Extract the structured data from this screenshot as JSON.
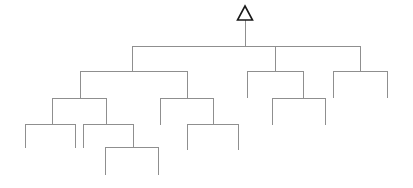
{
  "figure": {
    "type": "dendrogram",
    "title": "",
    "background_color": "#ffffff",
    "link_color": "#8f8f8f",
    "marker_color": "#1a1a1a",
    "orientation": "top-down",
    "width": 413,
    "height": 188
  },
  "root_marker": {
    "name": "root-triangle",
    "shape": "triangle",
    "x": 245,
    "y_top": 6,
    "y_bottom": 20,
    "half_width": 7.5,
    "fill": "#ffffff",
    "stroke": "#1a1a1a"
  },
  "chart_data": {
    "type": "dendrogram",
    "title": "",
    "xlabel": "",
    "ylabel": "",
    "grid": false,
    "legend": false,
    "root_symbol": "triangle",
    "levels": [
      46,
      71,
      98,
      124,
      147,
      175
    ],
    "merges": [
      {
        "id": "m0",
        "level_y": 46,
        "x": 245,
        "children_x": [
          132,
          275,
          360
        ],
        "label": "root-merge"
      },
      {
        "id": "m1",
        "level_y": 71,
        "x": 132,
        "children_x": [
          80,
          187
        ],
        "label": "left-merge"
      },
      {
        "id": "m2",
        "level_y": 71,
        "x": 275,
        "children_x": [
          247,
          303
        ],
        "label": "middle-merge"
      },
      {
        "id": "m3",
        "level_y": 71,
        "x": 360,
        "children_x": [
          333,
          387
        ],
        "label": "right-merge"
      },
      {
        "id": "m4",
        "level_y": 98,
        "x": 80,
        "children_x": [
          52,
          106
        ],
        "label": "left-a-merge"
      },
      {
        "id": "m5",
        "level_y": 98,
        "x": 187,
        "children_x": [
          160,
          213
        ],
        "label": "left-b-merge"
      },
      {
        "id": "m6",
        "level_y": 98,
        "x": 303,
        "children_x": [
          272,
          325
        ],
        "label": "middle-b-merge"
      },
      {
        "id": "m7",
        "level_y": 124,
        "x": 52,
        "children_x": [
          25,
          75
        ],
        "label": "leaf-group-1"
      },
      {
        "id": "m8",
        "level_y": 124,
        "x": 106,
        "children_x": [
          83,
          133
        ],
        "label": "leaf-group-2"
      },
      {
        "id": "m9",
        "level_y": 124,
        "x": 213,
        "children_x": [
          187,
          238
        ],
        "label": "leaf-group-3"
      },
      {
        "id": "m10",
        "level_y": 147,
        "x": 133,
        "children_x": [
          105,
          158
        ],
        "label": "leaf-group-4"
      }
    ],
    "leaves": [
      {
        "x": 25,
        "y_top": 124,
        "y_bottom": 148,
        "label": "leaf-1"
      },
      {
        "x": 75,
        "y_top": 124,
        "y_bottom": 148,
        "label": "leaf-2"
      },
      {
        "x": 83,
        "y_top": 124,
        "y_bottom": 148,
        "label": "leaf-3"
      },
      {
        "x": 105,
        "y_top": 147,
        "y_bottom": 175,
        "label": "leaf-4"
      },
      {
        "x": 158,
        "y_top": 147,
        "y_bottom": 175,
        "label": "leaf-5"
      },
      {
        "x": 160,
        "y_top": 98,
        "y_bottom": 125,
        "label": "leaf-6"
      },
      {
        "x": 187,
        "y_top": 124,
        "y_bottom": 150,
        "label": "leaf-7"
      },
      {
        "x": 238,
        "y_top": 124,
        "y_bottom": 150,
        "label": "leaf-8"
      },
      {
        "x": 247,
        "y_top": 71,
        "y_bottom": 98,
        "label": "leaf-9"
      },
      {
        "x": 272,
        "y_top": 98,
        "y_bottom": 125,
        "label": "leaf-10"
      },
      {
        "x": 325,
        "y_top": 98,
        "y_bottom": 125,
        "label": "leaf-11"
      },
      {
        "x": 333,
        "y_top": 71,
        "y_bottom": 98,
        "label": "leaf-12"
      },
      {
        "x": 387,
        "y_top": 71,
        "y_bottom": 98,
        "label": "leaf-13"
      }
    ],
    "leaf_count": 13,
    "merge_count": 11
  }
}
